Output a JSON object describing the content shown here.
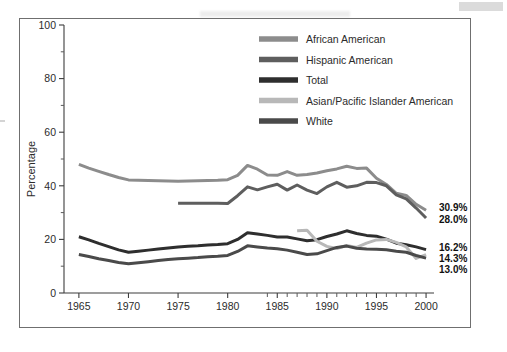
{
  "figure": {
    "background_color": "#ffffff",
    "frame_color": "#6f6f6f"
  },
  "chart_data": {
    "type": "line",
    "title": "",
    "subtitle": "",
    "xlabel": "",
    "ylabel": "Percentage",
    "xlim": [
      1963.5,
      2000.8
    ],
    "ylim": [
      0,
      100
    ],
    "grid": false,
    "legend_position": "top-right",
    "y_ticks": [
      0,
      20,
      40,
      60,
      80,
      100
    ],
    "y_minor_ticks": [
      10,
      30,
      50,
      70,
      90
    ],
    "x_ticks": [
      1965,
      1970,
      1975,
      1980,
      1985,
      1990,
      1995,
      2000
    ],
    "x_minor_ticks": [
      1984,
      1986,
      1987,
      1988,
      1989,
      1991,
      1992,
      1993,
      1994,
      1996,
      1997,
      1998,
      1999
    ],
    "x_tick_labels": [
      "1965",
      "1970",
      "1975",
      "1980",
      "1985",
      "1990",
      "1995",
      "2000"
    ],
    "series": [
      {
        "name": "African American",
        "color": "#8c8c8c",
        "x": [
          1965,
          1966,
          1967,
          1968,
          1969,
          1970,
          1971,
          1972,
          1973,
          1974,
          1975,
          1976,
          1977,
          1978,
          1979,
          1980,
          1981,
          1982,
          1983,
          1984,
          1985,
          1986,
          1987,
          1988,
          1989,
          1990,
          1991,
          1992,
          1993,
          1994,
          1995,
          1996,
          1997,
          1998,
          1999,
          2000
        ],
        "y": [
          48.0,
          46.6,
          45.4,
          44.2,
          43.1,
          42.2,
          42.1,
          42.0,
          41.9,
          41.8,
          41.7,
          41.8,
          41.9,
          42.0,
          42.1,
          42.3,
          43.9,
          47.6,
          46.2,
          44.0,
          43.9,
          45.3,
          43.9,
          44.2,
          44.8,
          45.6,
          46.3,
          47.3,
          46.5,
          46.6,
          42.8,
          40.5,
          37.2,
          36.4,
          33.1,
          30.9
        ],
        "end_label": "30.9%"
      },
      {
        "name": "Hispanic American",
        "color": "#5e5e5e",
        "x": [
          1975,
          1976,
          1977,
          1978,
          1979,
          1980,
          1981,
          1982,
          1983,
          1984,
          1985,
          1986,
          1987,
          1988,
          1989,
          1990,
          1991,
          1992,
          1993,
          1994,
          1995,
          1996,
          1997,
          1998,
          1999,
          2000
        ],
        "y": [
          33.5,
          33.5,
          33.5,
          33.5,
          33.5,
          33.4,
          36.3,
          39.6,
          38.5,
          39.6,
          40.6,
          38.4,
          40.3,
          38.4,
          37.1,
          39.6,
          41.3,
          39.5,
          40.0,
          41.3,
          41.2,
          40.0,
          36.6,
          35.1,
          31.7,
          28.0
        ],
        "end_label": "28.0%"
      },
      {
        "name": "Total",
        "color": "#2e2e2e",
        "x": [
          1965,
          1966,
          1967,
          1968,
          1969,
          1970,
          1971,
          1972,
          1973,
          1974,
          1975,
          1976,
          1977,
          1978,
          1979,
          1980,
          1981,
          1982,
          1983,
          1984,
          1985,
          1986,
          1987,
          1988,
          1989,
          1990,
          1991,
          1992,
          1993,
          1994,
          1995,
          1996,
          1997,
          1998,
          1999,
          2000
        ],
        "y": [
          21.0,
          19.8,
          18.5,
          17.3,
          16.1,
          15.2,
          15.6,
          16.0,
          16.4,
          16.8,
          17.2,
          17.4,
          17.6,
          17.9,
          18.1,
          18.4,
          20.0,
          22.5,
          22.0,
          21.5,
          20.9,
          20.9,
          20.2,
          19.5,
          19.9,
          21.1,
          22.0,
          23.2,
          22.2,
          21.5,
          21.2,
          20.1,
          18.6,
          18.0,
          17.2,
          16.2
        ],
        "end_label": "16.2%"
      },
      {
        "name": "Asian/Pacific Islander American",
        "color": "#b8b8b8",
        "x": [
          1987,
          1988,
          1989,
          1990,
          1991,
          1992,
          1993,
          1994,
          1995,
          1996,
          1997,
          1998,
          1999,
          2000
        ],
        "y": [
          23.2,
          23.4,
          19.3,
          17.4,
          16.6,
          17.7,
          17.0,
          18.6,
          19.8,
          20.0,
          18.9,
          17.2,
          12.9,
          14.3
        ],
        "end_label": "14.3%"
      },
      {
        "name": "White",
        "color": "#4a4a4a",
        "x": [
          1965,
          1966,
          1967,
          1968,
          1969,
          1970,
          1971,
          1972,
          1973,
          1974,
          1975,
          1976,
          1977,
          1978,
          1979,
          1980,
          1981,
          1982,
          1983,
          1984,
          1985,
          1986,
          1987,
          1988,
          1989,
          1990,
          1991,
          1992,
          1993,
          1994,
          1995,
          1996,
          1997,
          1998,
          1999,
          2000
        ],
        "y": [
          14.4,
          13.6,
          12.8,
          12.1,
          11.4,
          10.9,
          11.3,
          11.7,
          12.1,
          12.5,
          12.8,
          13.0,
          13.2,
          13.5,
          13.7,
          14.0,
          15.5,
          17.6,
          17.2,
          16.8,
          16.5,
          16.0,
          15.2,
          14.4,
          14.6,
          15.8,
          17.0,
          17.5,
          16.7,
          16.4,
          16.3,
          16.1,
          15.6,
          15.2,
          14.0,
          13.0
        ],
        "end_label": "13.0%"
      }
    ],
    "end_labels": [
      {
        "text": "30.9%",
        "value": 30.9
      },
      {
        "text": "28.0%",
        "value": 28.0
      },
      {
        "text": "16.2%",
        "value": 16.2
      },
      {
        "text": "14.3%",
        "value": 14.3
      },
      {
        "text": "13.0%",
        "value": 13.0
      }
    ]
  },
  "legend": {
    "items": [
      {
        "label": "African American",
        "color": "#8c8c8c"
      },
      {
        "label": "Hispanic American",
        "color": "#5e5e5e"
      },
      {
        "label": "Total",
        "color": "#2e2e2e"
      },
      {
        "label": "Asian/Pacific Islander American",
        "color": "#b8b8b8"
      },
      {
        "label": "White",
        "color": "#4a4a4a"
      }
    ]
  }
}
